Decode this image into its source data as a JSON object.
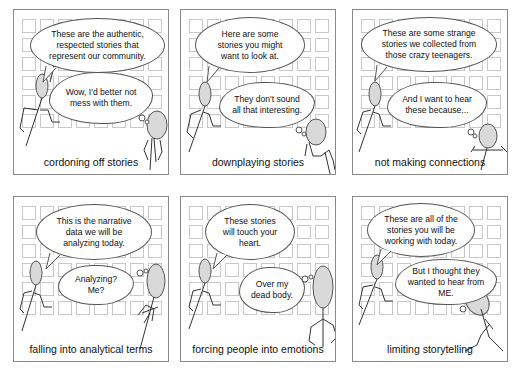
{
  "panels": [
    {
      "id": "cordoning",
      "speech": "These are the authentic, respected stories that represent our community.",
      "thought": "Wow, I'd better not mess with them.",
      "caption": "cordoning off stories"
    },
    {
      "id": "downplaying",
      "speech": "Here are some stories you might want to look at.",
      "thought": "They don't sound all that interesting.",
      "caption": "downplaying stories"
    },
    {
      "id": "not-connecting",
      "speech": "These are some strange stories we collected from those crazy teenagers.",
      "thought": "And I want to hear these because...",
      "caption": "not making connections"
    },
    {
      "id": "analytical",
      "speech": "This is the narrative data we will be analyzing today.",
      "thought": "Analyzing? Me?",
      "caption": "falling into analytical terms"
    },
    {
      "id": "emotions",
      "speech": "These stories will touch your heart.",
      "thought": "Over my dead body.",
      "caption": "forcing people into emotions"
    },
    {
      "id": "limiting",
      "speech": "These are all of the stories you will be working with today.",
      "thought": "But I thought they wanted to hear from ME.",
      "caption": "limiting storytelling"
    }
  ],
  "colors": {
    "figure_fill": "#d9d9d9",
    "grid_square": "#c8c8c8",
    "panel_border": "#8a8a8a",
    "text": "#111111"
  }
}
